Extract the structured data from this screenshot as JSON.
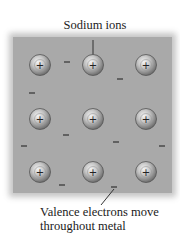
{
  "labels": {
    "top": "Sodium ions",
    "bottom_line1": "Valence electrons move",
    "bottom_line2": "throughout metal"
  },
  "ions": {
    "symbol": "+",
    "positions": [
      [
        40,
        65
      ],
      [
        93,
        65
      ],
      [
        146,
        65
      ],
      [
        40,
        119
      ],
      [
        93,
        119
      ],
      [
        146,
        119
      ],
      [
        40,
        172
      ],
      [
        93,
        172
      ],
      [
        146,
        172
      ]
    ]
  },
  "electrons": {
    "symbol": "−",
    "positions": [
      [
        67,
        62
      ],
      [
        120,
        79
      ],
      [
        32,
        93
      ],
      [
        66,
        135
      ],
      [
        116,
        142
      ],
      [
        24,
        146
      ],
      [
        162,
        146
      ],
      [
        62,
        185
      ],
      [
        114,
        187
      ]
    ]
  },
  "colors": {
    "background": "#a9a9a9",
    "ion_fill": "#b0b0b0",
    "ion_edge": "#555555",
    "text": "#1a1a1a"
  }
}
